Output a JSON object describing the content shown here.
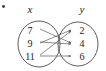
{
  "figure": {
    "type": "mapping-diagram",
    "corner_mark": "•",
    "background_color": "#ffffff",
    "stroke_color": "#4a4a4a",
    "arrow_color": "#5a5a5a",
    "text_color": "#1b1b1b"
  },
  "domain_set": {
    "label": "x",
    "elements": [
      {
        "value": "7",
        "cx": 30,
        "cy": 31
      },
      {
        "value": "9",
        "cx": 30,
        "cy": 44
      },
      {
        "value": "11",
        "cx": 30,
        "cy": 57
      }
    ]
  },
  "range_set": {
    "label": "y",
    "elements": [
      {
        "value": "2",
        "cx": 82,
        "cy": 31
      },
      {
        "value": "4",
        "cx": 82,
        "cy": 44
      },
      {
        "value": "6",
        "cx": 82,
        "cy": 57
      }
    ]
  },
  "mappings": [
    {
      "from": "7",
      "to": "4",
      "path": "M 40 29 L 71 43"
    },
    {
      "from": "9",
      "to": "4",
      "path": "M 40 42 L 71 44"
    },
    {
      "from": "9",
      "to": "2",
      "path": "M 40 43 L 71 30"
    },
    {
      "from": "11",
      "to": "2",
      "path": "M 40 55 L 71 31"
    },
    {
      "from": "11",
      "to": "6",
      "path": "M 40 56 L 71 56"
    }
  ],
  "chart_data": {
    "type": "diagram",
    "title": "",
    "diagram_kind": "mapping-diagram",
    "sets": [
      {
        "name": "x",
        "side": "left",
        "values": [
          "7",
          "9",
          "11"
        ]
      },
      {
        "name": "y",
        "side": "right",
        "values": [
          "2",
          "4",
          "6"
        ]
      }
    ],
    "edges": [
      [
        "7",
        "4"
      ],
      [
        "9",
        "4"
      ],
      [
        "9",
        "2"
      ],
      [
        "11",
        "2"
      ],
      [
        "11",
        "6"
      ]
    ]
  }
}
